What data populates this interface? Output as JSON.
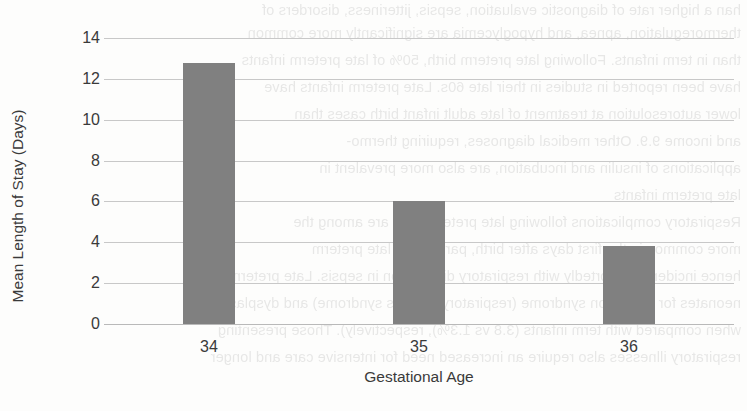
{
  "chart_data": {
    "type": "bar",
    "title": "",
    "subtitle": "",
    "xlabel": "Gestational Age",
    "ylabel": "Mean Length of Stay (Days)",
    "categories": [
      "34",
      "35",
      "36"
    ],
    "values": [
      12.8,
      6.0,
      3.8
    ],
    "series": [
      {
        "name": "Mean Length of Stay (Days)",
        "values": [
          12.8,
          6.0,
          3.8
        ]
      }
    ],
    "ylim": [
      0,
      14
    ],
    "ytick_values": [
      0,
      2,
      4,
      6,
      8,
      10,
      12,
      14
    ],
    "ytick_labels": [
      "0",
      "2",
      "4",
      "6",
      "8",
      "10",
      "12",
      "14"
    ],
    "grid": true,
    "legend": false,
    "legend_position": "none",
    "bar_color": "#808080",
    "gridline_color": "#c8c8c8",
    "text_color": "#3a3a3a",
    "background_color": "#fdfdfc"
  },
  "background_bleed": {
    "description": "faint mirrored show-through text from the reverse side of the scanned page",
    "lines": [
      "han a higher rate of diagnostic evaluation, sepsis, jitteriness, disorders of",
      "thermoregulation, apnea, and hypoglycemia are significantly more common",
      "than in term infants. Following late preterm birth, 50% of late preterm infants",
      "have been reported in studies in their late 60s. Late preterm infants have",
      "lower autoresolution at treatment of late adult infant birth cases than",
      "and income 9.9. Other medical diagnoses, requiring thermo-",
      "applications of insulin and incubation, are also more prevalent in",
      "late preterm infants",
      "Respiratory complications following late preterm birth are among the",
      "more common in the first days after birth, particularly late preterm",
      "hence incidence reportedly with respiratory distribution in sepsis. Late preterm",
      "neonates for aspiration syndrome (respiratory distress syndrome) and dysplasia",
      "when compared with term infants (3.8 vs 1.3%), respectively). Those presenting",
      "respiratory illnesses also require an increased need for intensive care and longer"
    ]
  },
  "page": {
    "width": 747,
    "height": 411
  }
}
